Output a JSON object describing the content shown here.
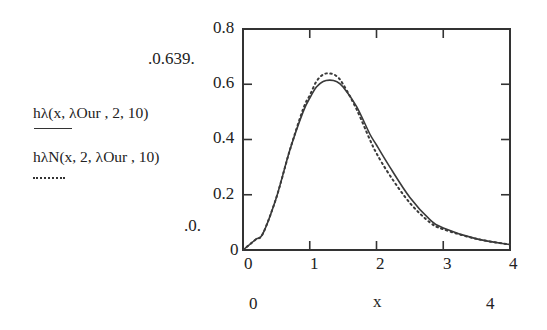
{
  "legend": {
    "series1_expr": "hλ(x, λOur , 2, 10)",
    "series1_style": "solid",
    "series2_expr": "hλN(x, 2, λOur , 10)",
    "series2_style": "dotted"
  },
  "y_range_labels": {
    "max": "0.639",
    "min": "0"
  },
  "x_range_labels": {
    "min": "0",
    "max": "4",
    "var": "x"
  },
  "chart_data": {
    "type": "line",
    "title": "",
    "xlabel": "x",
    "ylabel": "",
    "xlim": [
      0,
      4
    ],
    "ylim": [
      0,
      0.8
    ],
    "grid": false,
    "legend_position": "left",
    "x_ticks": [
      "0",
      "1",
      "2",
      "3",
      "4"
    ],
    "y_ticks": [
      "0",
      "0.2",
      "0.4",
      "0.6",
      "0.8"
    ],
    "x": [
      0,
      0.1,
      0.2,
      0.3,
      0.5,
      0.7,
      0.9,
      1.0,
      1.1,
      1.2,
      1.3,
      1.4,
      1.5,
      1.7,
      1.9,
      2.0,
      2.2,
      2.5,
      2.8,
      3.0,
      3.5,
      4.0
    ],
    "series": [
      {
        "name": "hλ(x, λOur , 2, 10)",
        "style": "solid",
        "values": [
          0,
          0.02,
          0.04,
          0.06,
          0.19,
          0.36,
          0.5,
          0.55,
          0.59,
          0.61,
          0.615,
          0.61,
          0.59,
          0.52,
          0.42,
          0.38,
          0.3,
          0.19,
          0.11,
          0.08,
          0.04,
          0.02
        ]
      },
      {
        "name": "hλN(x, 2, λOur , 10)",
        "style": "dotted",
        "values": [
          0,
          0.02,
          0.04,
          0.06,
          0.19,
          0.36,
          0.51,
          0.56,
          0.61,
          0.635,
          0.639,
          0.63,
          0.6,
          0.51,
          0.4,
          0.35,
          0.27,
          0.17,
          0.1,
          0.075,
          0.04,
          0.02
        ]
      }
    ]
  }
}
